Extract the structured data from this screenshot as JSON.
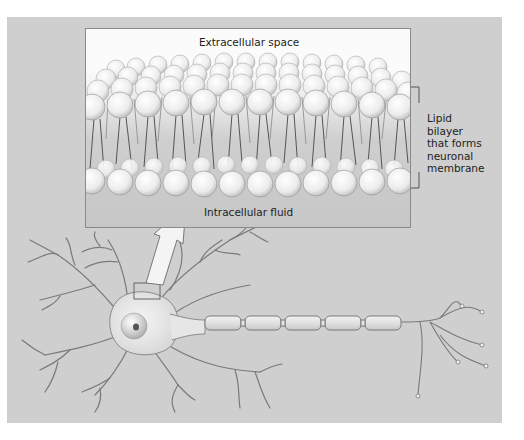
{
  "figure": {
    "type": "biology-diagram",
    "background_color": "#cfcfcf"
  },
  "inset": {
    "top_label": "Extracellular space",
    "bottom_label": "Intracellular fluid"
  },
  "callout": {
    "lines": [
      "Lipid",
      "bilayer",
      "that forms",
      "neuronal",
      "membrane"
    ]
  },
  "neuron": {
    "parts": [
      "cell-body",
      "nucleus",
      "dendrites",
      "axon",
      "myelin-sheath",
      "axon-terminals"
    ],
    "myelin_segments": 5
  }
}
